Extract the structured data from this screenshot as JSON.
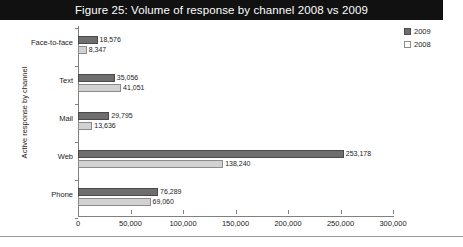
{
  "title": "Figure 25: Volume of response by channel 2008 vs 2009",
  "legend": {
    "position": "top-right",
    "entries": [
      {
        "label": "2009",
        "color": "#6e6e6e"
      },
      {
        "label": "2008",
        "color": "#d2d2d2"
      }
    ]
  },
  "chart_data": {
    "type": "bar",
    "orientation": "horizontal",
    "title": "Figure 25: Volume of response by channel 2008 vs 2009",
    "xlabel": "",
    "ylabel": "Active response by channel",
    "categories": [
      "Face-to-face",
      "Text",
      "Mail",
      "Web",
      "Phone"
    ],
    "series": [
      {
        "name": "2009",
        "color": "#6e6e6e",
        "values": [
          18576,
          35056,
          29795,
          253178,
          76289
        ],
        "labels": [
          "18,576",
          "35,056",
          "29,795",
          "253,178",
          "76,289"
        ]
      },
      {
        "name": "2008",
        "color": "#d2d2d2",
        "values": [
          8347,
          41051,
          13636,
          138240,
          69060
        ],
        "labels": [
          "8,347",
          "41,051",
          "13,636",
          "138,240",
          "69,060"
        ]
      }
    ],
    "xlim": [
      0,
      300000
    ],
    "xticks": [
      0,
      50000,
      100000,
      150000,
      200000,
      250000,
      300000
    ],
    "xticklabels": [
      "0",
      "50,000",
      "100,000",
      "150,000",
      "200,000",
      "250,000",
      "300,000"
    ],
    "grid": false
  }
}
